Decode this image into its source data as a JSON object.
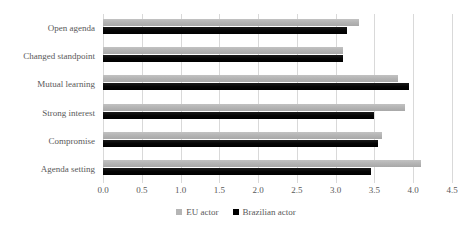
{
  "chart_data": {
    "type": "bar",
    "orientation": "horizontal",
    "title": "",
    "subtitle": "",
    "xlabel": "",
    "ylabel": "",
    "categories": [
      "Open agenda",
      "Changed standpoint",
      "Mutual learning",
      "Strong interest",
      "Compromise",
      "Agenda setting"
    ],
    "series": [
      {
        "name": "EU actor",
        "color": "#b5b5b5",
        "values": [
          3.3,
          3.1,
          3.8,
          3.9,
          3.6,
          4.1
        ]
      },
      {
        "name": "Brazilian actor",
        "color": "#000000",
        "values": [
          3.15,
          3.1,
          3.95,
          3.5,
          3.55,
          3.45
        ]
      }
    ],
    "xlim": [
      0.0,
      4.5
    ],
    "xticks": [
      "0.0",
      "0.5",
      "1.0",
      "1.5",
      "2.0",
      "2.5",
      "3.0",
      "3.5",
      "4.0",
      "4.5"
    ],
    "xtick_values": [
      0.0,
      0.5,
      1.0,
      1.5,
      2.0,
      2.5,
      3.0,
      3.5,
      4.0,
      4.5
    ],
    "grid": true,
    "grid_axis": "x",
    "grid_color": "#d9d9d9",
    "legend_position": "bottom",
    "background": "#ffffff",
    "text_color": "#595959"
  }
}
